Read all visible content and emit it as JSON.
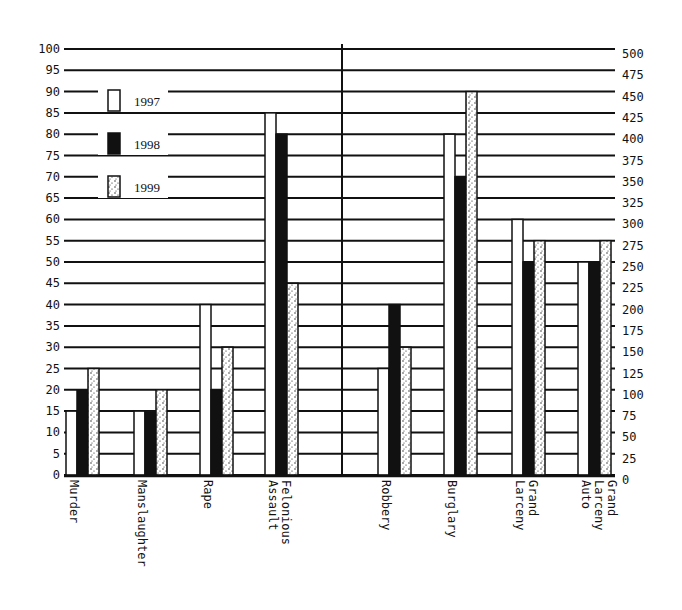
{
  "chart_data": {
    "type": "bar",
    "title": "",
    "xlabel": "",
    "ylabel": "",
    "categories": [
      "Murder",
      "Manslaughter",
      "Rape",
      "Felonious Assault",
      "Robbery",
      "Burglary",
      "Grand Larceny",
      "Grand Larceny Auto"
    ],
    "category_labels": [
      [
        "Murder"
      ],
      [
        "Manslaughter"
      ],
      [
        "Rape"
      ],
      [
        "Felonious",
        "Assault"
      ],
      [
        "Robbery"
      ],
      [
        "Burglary"
      ],
      [
        "Grand",
        "Larceny"
      ],
      [
        "Grand",
        "Larceny",
        "Auto"
      ]
    ],
    "axis_assignment": [
      "left",
      "left",
      "left",
      "left",
      "right",
      "right",
      "right",
      "right"
    ],
    "series": [
      {
        "name": "1997",
        "fill": "white",
        "values": [
          15,
          15,
          40,
          85,
          125,
          400,
          300,
          250
        ]
      },
      {
        "name": "1998",
        "fill": "black",
        "values": [
          20,
          15,
          20,
          80,
          200,
          350,
          250,
          250
        ]
      },
      {
        "name": "1999",
        "fill": "stippled",
        "values": [
          25,
          20,
          30,
          45,
          150,
          450,
          275,
          275
        ]
      }
    ],
    "left_axis": {
      "ylim": [
        0,
        100
      ],
      "step": 5,
      "ticks": [
        "0",
        "5",
        "10",
        "15",
        "20",
        "25",
        "30",
        "35",
        "40",
        "45",
        "50",
        "55",
        "60",
        "65",
        "70",
        "75",
        "80",
        "85",
        "90",
        "95",
        "100"
      ]
    },
    "right_axis": {
      "ylim": [
        0,
        500
      ],
      "step": 25,
      "ticks": [
        "0",
        "25",
        "50",
        "75",
        "100",
        "125",
        "150",
        "175",
        "200",
        "225",
        "250",
        "275",
        "300",
        "325",
        "350",
        "375",
        "400",
        "425",
        "450",
        "475",
        "500"
      ]
    },
    "grid": true,
    "legend_position": "upper-left inside plot",
    "legend": [
      {
        "label": "1997",
        "fill": "white"
      },
      {
        "label": "1998",
        "fill": "black"
      },
      {
        "label": "1999",
        "fill": "stippled"
      }
    ]
  },
  "colors": {
    "ink": "#111111",
    "paper": "#ffffff"
  }
}
